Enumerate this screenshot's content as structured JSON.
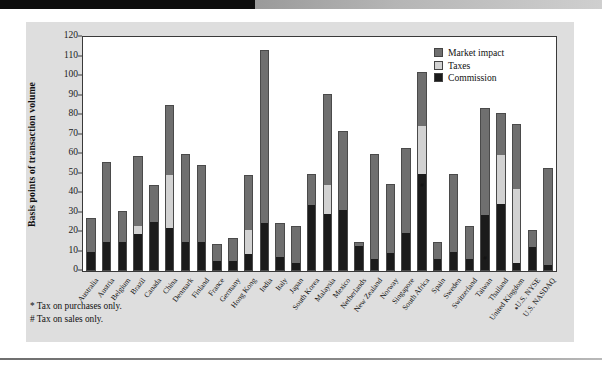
{
  "figure": {
    "y_axis_title": "Basis points of transaction volume"
  },
  "legend": {
    "position": "top-right",
    "items": [
      {
        "label": "Market impact",
        "color": "#6f6f6f",
        "key": "market_impact"
      },
      {
        "label": "Taxes",
        "color": "#d2d2d2",
        "key": "taxes"
      },
      {
        "label": "Commission",
        "color": "#1b1b1b",
        "key": "commission"
      }
    ]
  },
  "footnotes": [
    "* Tax on purchases only.",
    "# Tax on sales only."
  ],
  "chart_data": {
    "type": "bar",
    "subtype": "stacked-vertical",
    "title": "",
    "xlabel": "",
    "ylabel": "Basis points of transaction volume",
    "ylim": [
      0,
      120
    ],
    "yticks": [
      0,
      10,
      20,
      30,
      40,
      50,
      60,
      70,
      80,
      90,
      100,
      110,
      120
    ],
    "grid": false,
    "stack_order": [
      "commission",
      "taxes",
      "market_impact"
    ],
    "categories": [
      "Australia",
      "Austria",
      "Belgium",
      "Brazil",
      "Canada",
      "China",
      "Denmark",
      "Finland",
      "France",
      "Germany",
      "Hong Kong",
      "India",
      "Italy",
      "Japan",
      "South Korea",
      "Malaysia",
      "Mexico",
      "Netherlands",
      "New Zealand",
      "Norway",
      "Singapore",
      "South Africa",
      "Spain",
      "Sweden",
      "Switzerland",
      "Taiwan",
      "Thailand",
      "United Kingdom",
      "U.S. NYSE",
      "U.S. NASDAQ"
    ],
    "series": [
      {
        "name": "Commission",
        "key": "commission",
        "color": "#1b1b1b",
        "values": [
          10,
          15,
          15,
          19,
          25,
          22,
          15,
          15,
          5,
          5,
          8.5,
          24.5,
          7,
          4,
          34,
          29,
          31.5,
          13,
          6,
          9,
          19.5,
          49.5,
          6,
          10,
          6,
          28.5,
          34.5,
          4,
          12.5,
          3
        ]
      },
      {
        "name": "Taxes",
        "key": "taxes",
        "color": "#d2d2d2",
        "values": [
          0,
          0,
          0,
          4,
          0,
          27,
          0,
          0,
          0,
          0,
          12.5,
          0,
          0,
          0,
          0,
          15,
          0,
          0,
          0,
          0,
          0,
          25,
          0,
          0,
          0,
          0,
          25,
          38,
          0,
          0
        ]
      },
      {
        "name": "Market impact",
        "key": "market_impact",
        "color": "#6f6f6f",
        "values": [
          17,
          41,
          16,
          36,
          19,
          36,
          45,
          39.5,
          9,
          12,
          28,
          89,
          17.5,
          19,
          15.5,
          47,
          40.5,
          2,
          54,
          35.5,
          43.5,
          27.5,
          9,
          39.5,
          17,
          55,
          21.5,
          33.5,
          8.5,
          50
        ]
      }
    ],
    "totals": [
      27,
      56,
      31,
      59,
      44,
      85,
      60,
      54.5,
      14,
      17,
      49,
      113.5,
      24.5,
      23,
      49.5,
      91,
      72,
      15,
      60,
      44.5,
      63,
      102,
      15,
      49.5,
      23,
      83.5,
      81,
      75.5,
      21,
      53
    ],
    "annotations": [
      {
        "category": "South Africa",
        "marker": "#",
        "at_value": 62
      },
      {
        "category": "Taiwan",
        "marker": "#",
        "at_value": 43
      },
      {
        "category": "United Kingdom",
        "marker": "*",
        "at_value": 25
      }
    ]
  }
}
